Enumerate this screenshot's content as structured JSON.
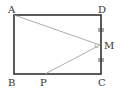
{
  "diagram": {
    "type": "geometry",
    "points": {
      "A": "A",
      "B": "B",
      "C": "C",
      "D": "D",
      "M": "M",
      "P": "P"
    },
    "segments": [
      "AD",
      "DC",
      "CB",
      "BA",
      "AM",
      "MP"
    ],
    "equal_marks": [
      "DM",
      "MC"
    ],
    "right_angle_at": "M",
    "colors": {
      "rect": "#333333",
      "inner": "#888888"
    }
  }
}
